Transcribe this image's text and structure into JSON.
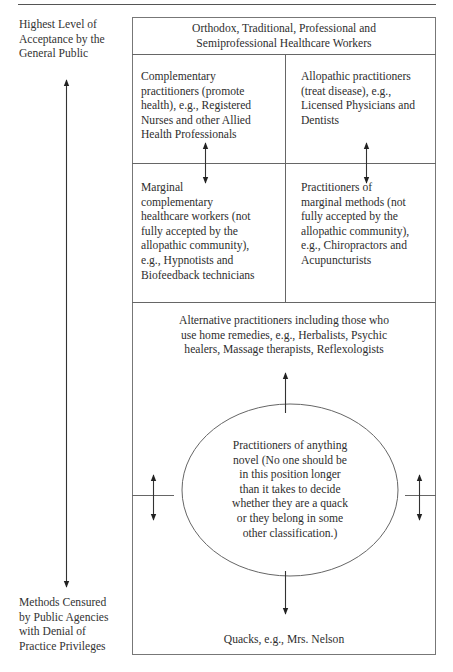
{
  "figure": {
    "left_axis": {
      "top_label": "Highest Level of Acceptance by the General Public",
      "top_label_lines": [
        "Highest Level of",
        "Acceptance by the",
        "General Public"
      ],
      "bottom_label": "Methods Censured by Public Agencies with Denial of Practice Privileges",
      "bottom_label_lines": [
        "Methods Censured",
        "by Public Agencies",
        "with Denial of",
        "Practice Privileges"
      ]
    },
    "header": {
      "lines": [
        "Orthodox, Traditional, Professional and",
        "Semiprofessional Healthcare Workers"
      ]
    },
    "grid": {
      "top_left": {
        "lines": [
          "Complementary",
          "practitioners (promote",
          "health), e.g., Registered",
          "Nurses and other Allied",
          "Health Professionals"
        ]
      },
      "top_right": {
        "lines": [
          "Allopathic practitioners",
          "(treat disease), e.g.,",
          "Licensed Physicians and",
          "Dentists"
        ]
      },
      "bottom_left": {
        "lines": [
          "Marginal",
          "complementary",
          "healthcare workers (not",
          "fully accepted by the",
          "allopathic community),",
          "e.g., Hypnotists and",
          "Biofeedback technicians"
        ]
      },
      "bottom_right": {
        "lines": [
          "Practitioners of",
          "marginal methods (not",
          "fully accepted by the",
          "allopathic community),",
          "e.g., Chiropractors and",
          "Acupuncturists"
        ]
      }
    },
    "alternative": {
      "lines": [
        "Alternative practitioners including those who",
        "use home remedies, e.g., Herbalists, Psychic",
        "healers, Massage therapists, Reflexologists"
      ]
    },
    "novel": {
      "lines": [
        "Practitioners of anything",
        "novel (No one should be",
        "in this position longer",
        "than it takes to decide",
        "whether they are a quack",
        "or they belong in some",
        "other classification.)"
      ]
    },
    "quacks": {
      "label": "Quacks, e.g., Mrs. Nelson"
    }
  }
}
